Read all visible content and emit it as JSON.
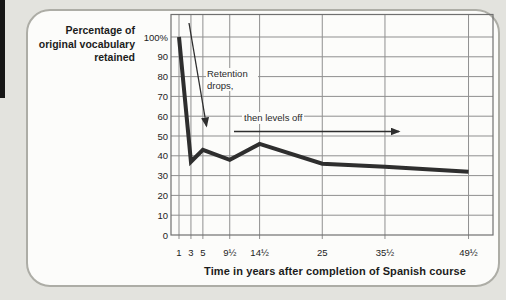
{
  "figure": {
    "y_axis_title_lines": [
      "Percentage of",
      "original vocabulary",
      "retained"
    ],
    "x_axis_title": "Time in years after completion of Spanish course",
    "annotations": {
      "drop": "Retention drops,",
      "level": "then levels off"
    }
  },
  "chart_data": {
    "type": "line",
    "title": "",
    "xlabel": "Time in years after completion of Spanish course",
    "ylabel": "Percentage of original vocabulary retained",
    "x": [
      1,
      3,
      5,
      9.5,
      14.5,
      25,
      35.5,
      49.5
    ],
    "x_tick_labels": [
      "1",
      "3",
      "5",
      "9½",
      "14½",
      "25",
      "35½",
      "49½"
    ],
    "values": [
      100,
      37,
      43,
      38,
      46,
      36,
      34.5,
      32
    ],
    "y_ticks": [
      0,
      10,
      20,
      30,
      40,
      50,
      60,
      70,
      80,
      90,
      100
    ],
    "y_tick_labels": [
      "0",
      "10",
      "20",
      "30",
      "40",
      "50",
      "60",
      "70",
      "80",
      "90",
      "100%"
    ],
    "ylim": [
      0,
      111
    ],
    "grid": true,
    "legend": null,
    "annotations": [
      {
        "text": "Retention drops,",
        "arrow": "diagonal-down"
      },
      {
        "text": "then levels off",
        "arrow": "horizontal-right"
      }
    ]
  },
  "colors": {
    "page_bg": "#e3e3de",
    "card_bg": "#fcfcfa",
    "card_border": "#adada6",
    "grid": "#8f8f8f",
    "grid_dark": "#707070",
    "line": "#2e2e2e",
    "text": "#1c1c1c",
    "edge_bar": "#161616"
  }
}
